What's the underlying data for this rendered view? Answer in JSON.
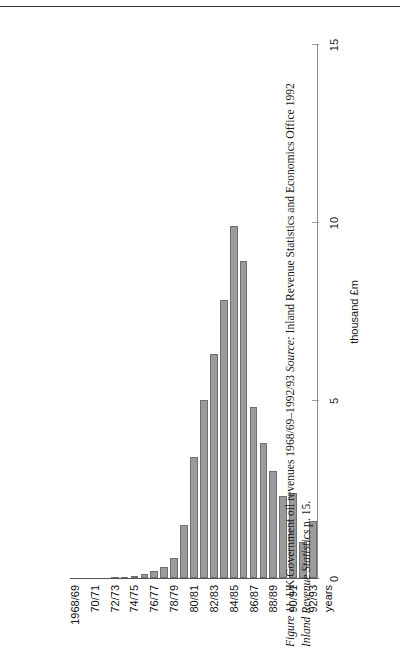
{
  "figure": {
    "label": "Figure 11",
    "title": "UK Government oil revenues 1968/69–1992/93",
    "source_label": "Source:",
    "source_text": "Inland Revenue Statistics and Economics Office 1992",
    "source_line2": "Inland Revenue Statistics",
    "source_page": "p. 15."
  },
  "chart_data": {
    "type": "bar",
    "orientation": "vertical-printed-sideways",
    "title": "UK Government oil revenues 1968/69–1992/93",
    "xlabel": "years",
    "ylabel": "thousand £m",
    "ylim": [
      0,
      15
    ],
    "yticks": [
      0,
      5,
      10,
      15
    ],
    "ytick_labels": [
      "0",
      "5",
      "10",
      "15"
    ],
    "grid": false,
    "legend": false,
    "bar_color": "#9b9b9b",
    "bar_edge_color": "#6f6f6f",
    "categories": [
      "1968/69",
      "69/70",
      "70/71",
      "71/72",
      "72/73",
      "73/74",
      "74/75",
      "75/76",
      "76/77",
      "77/78",
      "78/79",
      "79/80",
      "80/81",
      "81/82",
      "82/83",
      "83/84",
      "84/85",
      "85/86",
      "86/87",
      "87/88",
      "88/89",
      "89/90",
      "90/91",
      "91/92",
      "92/93"
    ],
    "tick_categories": [
      "1968/69",
      "70/71",
      "72/73",
      "74/75",
      "76/77",
      "78/79",
      "80/81",
      "82/83",
      "84/85",
      "86/87",
      "88/89",
      "90/91",
      "92/93"
    ],
    "values": [
      0.0,
      0.0,
      0.0,
      0.0,
      0.02,
      0.03,
      0.05,
      0.1,
      0.2,
      0.3,
      0.55,
      1.5,
      3.4,
      5.0,
      6.3,
      7.8,
      9.9,
      8.9,
      4.8,
      3.8,
      3.0,
      2.3,
      2.4,
      1.0,
      1.6
    ],
    "units": "thousand £m"
  }
}
